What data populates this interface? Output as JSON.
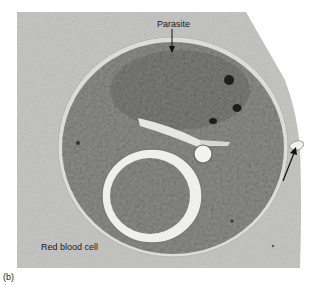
{
  "figure": {
    "panel_label": "(b)",
    "labels": {
      "parasite": "Parasite",
      "red_blood_cell": "Red blood cell"
    },
    "colors": {
      "background": "#ffffff",
      "rbc_cytoplasm": "#c9c9c7",
      "parasite_body": "#8a8a88",
      "membrane": "#e8e8e6",
      "vacuole_ring": "#f0f0ee",
      "dark_granule": "#222222",
      "arrow": "#111111"
    }
  }
}
